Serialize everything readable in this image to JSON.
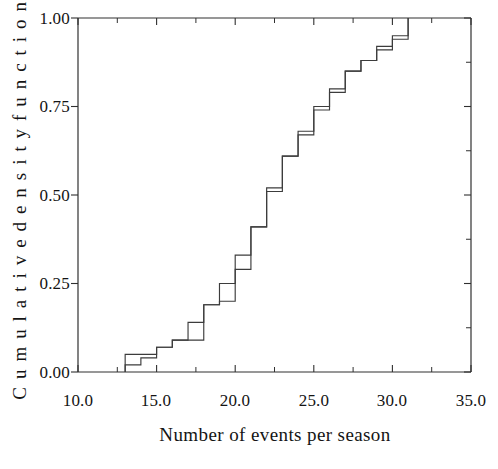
{
  "figure": {
    "background_color": "#ffffff",
    "line_color": "#3c3c3c",
    "axis_color": "#303030"
  },
  "axes": {
    "x_title": "Number of events per season",
    "y_title": "C u m u l a t i v e   d e n s i t y   f u n c t i o n",
    "x_ticks": [
      "10.0",
      "15.0",
      "20.0",
      "25.0",
      "30.0",
      "35.0"
    ],
    "y_ticks": [
      "0.00",
      "0.25",
      "0.50",
      "0.75",
      "1.00"
    ]
  },
  "chart_data": {
    "type": "line",
    "title": "",
    "xlabel": "Number of events per season",
    "ylabel": "Cumulative density function",
    "xlim": [
      10.0,
      35.0
    ],
    "ylim": [
      0.0,
      1.0
    ],
    "x_tick_values": [
      10.0,
      15.0,
      20.0,
      25.0,
      30.0,
      35.0
    ],
    "x_minor_tick_values": [
      12.5,
      17.5,
      22.5,
      27.5,
      32.5
    ],
    "y_tick_values": [
      0.0,
      0.25,
      0.5,
      0.75,
      1.0
    ],
    "y_minor_tick_values": [
      0.125,
      0.375,
      0.625,
      0.875
    ],
    "grid": false,
    "legend": "none",
    "step_style": "post",
    "series": [
      {
        "name": "empirical-cdf",
        "x": [
          13,
          13,
          14,
          15,
          16,
          17,
          18,
          19,
          20,
          21,
          22,
          23,
          24,
          25,
          26,
          27,
          28,
          29,
          30,
          31,
          31
        ],
        "y": [
          0.0,
          0.05,
          0.05,
          0.07,
          0.09,
          0.14,
          0.19,
          0.25,
          0.33,
          0.41,
          0.51,
          0.61,
          0.67,
          0.74,
          0.79,
          0.85,
          0.88,
          0.91,
          0.94,
          0.96,
          1.0
        ]
      },
      {
        "name": "fitted-cdf",
        "x": [
          13,
          13,
          14,
          15,
          16,
          17,
          18,
          19,
          20,
          21,
          22,
          23,
          24,
          25,
          26,
          27,
          28,
          29,
          30,
          31,
          31
        ],
        "y": [
          0.0,
          0.02,
          0.04,
          0.07,
          0.09,
          0.09,
          0.19,
          0.2,
          0.29,
          0.41,
          0.52,
          0.61,
          0.68,
          0.75,
          0.8,
          0.85,
          0.88,
          0.92,
          0.95,
          0.97,
          1.0
        ]
      }
    ]
  }
}
